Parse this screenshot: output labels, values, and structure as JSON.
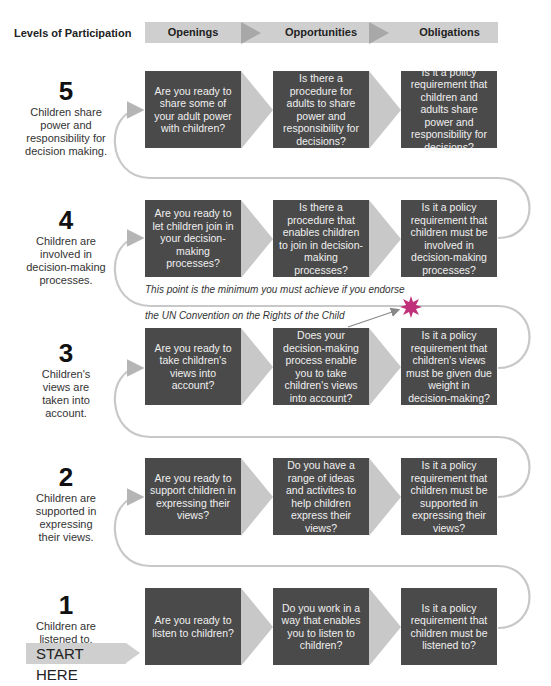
{
  "title": "Levels of Participation",
  "header": {
    "stages": [
      "Openings",
      "Opportunities",
      "Obligations"
    ]
  },
  "levels": [
    {
      "number": "5",
      "description": "Children share power and responsibility for decision making.",
      "openings": "Are you ready to share some of your adult power with children?",
      "opportunities": "Is there a procedure for adults to share power and responsibility for decisions?",
      "obligations": "Is it a policy requirement that children and adults share power and responsibility for decisions?"
    },
    {
      "number": "4",
      "description": "Children are involved in decision-making processes.",
      "openings": "Are you ready to let children join in your decision-making processes?",
      "opportunities": "Is there a procedure that enables children to join in decision-making processes?",
      "obligations": "Is it a policy requirement that children must be involved in decision-making processes?"
    },
    {
      "number": "3",
      "description": "Children's views are taken into account.",
      "openings": "Are you ready to take children's views into account?",
      "opportunities": "Does your decision-making process enable you to take children's views into account?",
      "obligations": "Is it a policy requirement that children's views must be given due weight in decision-making?"
    },
    {
      "number": "2",
      "description": "Children are supported in expressing their views.",
      "openings": "Are you ready to support children in expressing their views?",
      "opportunities": "Do you have a range of ideas and activites to help children express their views?",
      "obligations": "Is it a policy requirement that children must be supported in expressing their views?"
    },
    {
      "number": "1",
      "description": "Children are listened to.",
      "openings": "Are you ready to listen to children?",
      "opportunities": "Do you work in a way that enables you to listen to children?",
      "obligations": "Is it a policy requirement that children must be listened to?"
    }
  ],
  "annotation": {
    "line1": "This point is the minimum you must achieve if you endorse",
    "line2": "the UN Convention on the Rights of the Child",
    "marker_color": "#c0307a"
  },
  "start_label": "START HERE",
  "colors": {
    "box": "#4a4a4a",
    "header": "#cfcfcf",
    "chevron": "#c8c8c8",
    "path": "#c8c8c8"
  }
}
